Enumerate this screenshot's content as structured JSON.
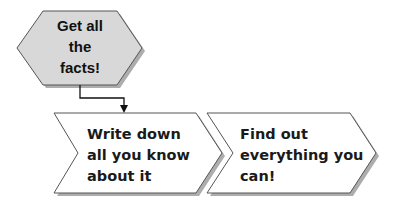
{
  "diagram": {
    "type": "flowchart",
    "colors": {
      "hexagon_fill": "#d8d8d8",
      "shape_stroke": "#555555",
      "shadow": "#7a7a7a",
      "chevron_fill": "#ffffff",
      "text": "#111111",
      "connector": "#111111"
    },
    "start_node": {
      "shape": "hexagon",
      "lines": [
        "Get all",
        "the",
        "facts!"
      ]
    },
    "steps": [
      {
        "shape": "chevron",
        "lines": [
          "Write down",
          "all you know",
          "about it"
        ]
      },
      {
        "shape": "chevron",
        "lines": [
          "Find out",
          "everything you",
          "can!"
        ]
      }
    ],
    "connectors": [
      {
        "from": "start_node",
        "to": "steps.0",
        "style": "elbow-arrow"
      }
    ]
  }
}
